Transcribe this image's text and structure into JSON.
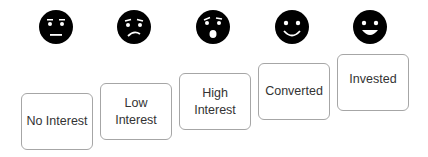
{
  "stages": [
    {
      "label": "No Interest",
      "face": "neutral-face-icon"
    },
    {
      "label": "Low\nInterest",
      "face": "worried-face-icon"
    },
    {
      "label": "High\nInterest",
      "face": "surprised-face-icon"
    },
    {
      "label": "Converted",
      "face": "smiling-face-icon"
    },
    {
      "label": "Invested",
      "face": "grinning-face-icon"
    }
  ],
  "colors": {
    "face": "#000000",
    "box_border": "#a6a6a6",
    "text": "#333333"
  }
}
